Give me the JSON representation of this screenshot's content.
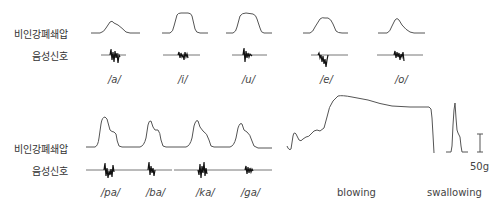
{
  "figure": {
    "rows": [
      {
        "id": "vowels",
        "pressure_label": "비인강폐쇄압",
        "signal_label": "음성신호",
        "phonemes": [
          "/a/",
          "/i/",
          "/u/",
          "/e/",
          "/o/"
        ]
      },
      {
        "id": "consonants",
        "pressure_label": "비인강폐쇄압",
        "signal_label": "음성신호",
        "phonemes": [
          "/pa/",
          "/ba/",
          "/ka/",
          "/ga/"
        ]
      }
    ],
    "tasks": {
      "blowing": "blowing",
      "swallowing": "swallowing"
    },
    "scale_bar": {
      "label": "50g"
    },
    "colors": {
      "trace": "#555555",
      "signal": "#111111",
      "text": "#333333"
    }
  }
}
